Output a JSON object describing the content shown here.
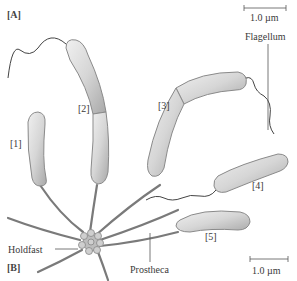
{
  "panels": {
    "a": "[A]",
    "b": "[B]"
  },
  "labels": {
    "flagellum": "Flagellum",
    "holdfast": "Holdfast",
    "prostheca": "Prostheca"
  },
  "cells": [
    "[1]",
    "[2]",
    "[3]",
    "[4]",
    "[5]"
  ],
  "scale_bars": {
    "top": "1.0 µm",
    "bottom": "1.0 µm"
  },
  "colors": {
    "cell_fill": "#d9d9d9",
    "cell_stroke": "#8a8a8a",
    "line": "#555555",
    "stalk": "#7a7a7a"
  }
}
